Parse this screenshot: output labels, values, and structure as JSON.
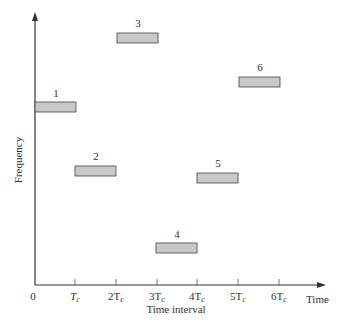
{
  "diagram": {
    "title": "",
    "y_axis_label": "Frequency",
    "x_axis_end_label": "Time",
    "x_axis_title": "Time interval",
    "x_ticks": [
      {
        "base": "0",
        "sub": ""
      },
      {
        "base": "T",
        "sub": "c"
      },
      {
        "base": "2T",
        "sub": "c"
      },
      {
        "base": "3T",
        "sub": "c"
      },
      {
        "base": "4T",
        "sub": "c"
      },
      {
        "base": "5T",
        "sub": "c"
      },
      {
        "base": "6T",
        "sub": "c"
      }
    ],
    "hops": [
      {
        "label": "1",
        "interval": 1
      },
      {
        "label": "2",
        "interval": 2
      },
      {
        "label": "3",
        "interval": 3
      },
      {
        "label": "4",
        "interval": 4
      },
      {
        "label": "5",
        "interval": 5
      },
      {
        "label": "6",
        "interval": 6
      }
    ],
    "colors": {
      "bar_fill": "#c8c8c8",
      "bar_stroke": "#444444",
      "axis": "#333333"
    }
  }
}
